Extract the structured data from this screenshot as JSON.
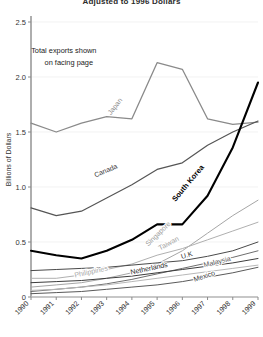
{
  "chart_data": {
    "type": "line",
    "title": "Adjusted to 1996 Dollars",
    "xlabel": "",
    "ylabel": "Billions of Dollars",
    "x": [
      1990,
      1991,
      1992,
      1993,
      1994,
      1995,
      1996,
      1997,
      1998,
      1999
    ],
    "xtick_labels": [
      "1990",
      "1991",
      "1992",
      "1993",
      "1994",
      "1995",
      "1996",
      "1997",
      "1998",
      "1999"
    ],
    "ytick_labels": [
      "0",
      "0.5",
      "1.0",
      "1.5",
      "2.0",
      "2.5"
    ],
    "ytick_values": [
      0,
      0.5,
      1.0,
      1.5,
      2.0,
      2.5
    ],
    "ylim": [
      0,
      2.5
    ],
    "xlim": [
      1990,
      1999
    ],
    "grid": "horizontal-faint",
    "legend": "inline-labels-on-lines",
    "annotations": [
      {
        "text": "Total exports shown",
        "x": 1991.3,
        "y": 2.22
      },
      {
        "text": "on facing page",
        "x": 1991.5,
        "y": 2.11
      }
    ],
    "series": [
      {
        "name": "Japan",
        "color": "#8a8a8a",
        "width": 1.3,
        "label_x": 1993.4,
        "label_y": 1.72,
        "label_rotation": -52,
        "label_color": "#8a8a8a",
        "label_bold": false,
        "values": [
          1.58,
          1.5,
          1.58,
          1.64,
          1.62,
          2.13,
          2.07,
          1.62,
          1.57,
          1.59
        ]
      },
      {
        "name": "Canada",
        "color": "#555555",
        "width": 1.2,
        "label_x": 1993.0,
        "label_y": 1.13,
        "label_rotation": -23,
        "label_color": "#3a3a3a",
        "label_bold": false,
        "values": [
          0.81,
          0.74,
          0.78,
          0.9,
          1.02,
          1.16,
          1.22,
          1.38,
          1.5,
          1.6
        ]
      },
      {
        "name": "South Korea",
        "color": "#000000",
        "width": 2.1,
        "label_x": 1996.3,
        "label_y": 1.02,
        "label_rotation": -50,
        "label_color": "#000000",
        "label_bold": true,
        "values": [
          0.42,
          0.38,
          0.35,
          0.42,
          0.52,
          0.66,
          0.66,
          0.92,
          1.36,
          1.95
        ]
      },
      {
        "name": "Singapore",
        "color": "#a6a6a6",
        "width": 1.0,
        "label_x": 1995.1,
        "label_y": 0.56,
        "label_rotation": -44,
        "label_color": "#9a9a9a",
        "label_bold": false,
        "values": [
          0.09,
          0.11,
          0.13,
          0.17,
          0.22,
          0.3,
          0.42,
          0.58,
          0.74,
          0.88
        ]
      },
      {
        "name": "Taiwan",
        "color": "#b0b0b0",
        "width": 1.0,
        "label_x": 1995.5,
        "label_y": 0.47,
        "label_rotation": -28,
        "label_color": "#a0a0a0",
        "label_bold": false,
        "values": [
          0.17,
          0.17,
          0.2,
          0.25,
          0.3,
          0.38,
          0.44,
          0.52,
          0.6,
          0.68
        ]
      },
      {
        "name": "U.K",
        "color": "#4a4a4a",
        "width": 1.0,
        "label_x": 1996.2,
        "label_y": 0.36,
        "label_rotation": -16,
        "label_color": "#2f2f2f",
        "label_bold": false,
        "values": [
          0.24,
          0.25,
          0.26,
          0.27,
          0.29,
          0.31,
          0.33,
          0.37,
          0.42,
          0.5
        ]
      },
      {
        "name": "Malaysia",
        "color": "#6e6e6e",
        "width": 1.0,
        "label_x": 1997.4,
        "label_y": 0.3,
        "label_rotation": -14,
        "label_color": "#555555",
        "label_bold": false,
        "values": [
          0.05,
          0.07,
          0.09,
          0.12,
          0.16,
          0.21,
          0.26,
          0.31,
          0.36,
          0.42
        ]
      },
      {
        "name": "Netherlands",
        "color": "#3d3d3d",
        "width": 1.0,
        "label_x": 1994.7,
        "label_y": 0.24,
        "label_rotation": -12,
        "label_color": "#262626",
        "label_bold": false,
        "values": [
          0.13,
          0.14,
          0.15,
          0.17,
          0.19,
          0.22,
          0.25,
          0.28,
          0.31,
          0.35
        ]
      },
      {
        "name": "Philippines",
        "color": "#b8b8b8",
        "width": 1.0,
        "label_x": 1992.4,
        "label_y": 0.21,
        "label_rotation": -12,
        "label_color": "#a8a8a8",
        "label_bold": false,
        "values": [
          0.06,
          0.07,
          0.09,
          0.11,
          0.14,
          0.17,
          0.2,
          0.23,
          0.26,
          0.29
        ]
      },
      {
        "name": "Mexico",
        "color": "#5a5a5a",
        "width": 1.0,
        "label_x": 1996.9,
        "label_y": 0.17,
        "label_rotation": -18,
        "label_color": "#3a3a3a",
        "label_bold": false,
        "values": [
          0.03,
          0.04,
          0.05,
          0.07,
          0.09,
          0.11,
          0.14,
          0.18,
          0.22,
          0.27
        ]
      }
    ]
  }
}
